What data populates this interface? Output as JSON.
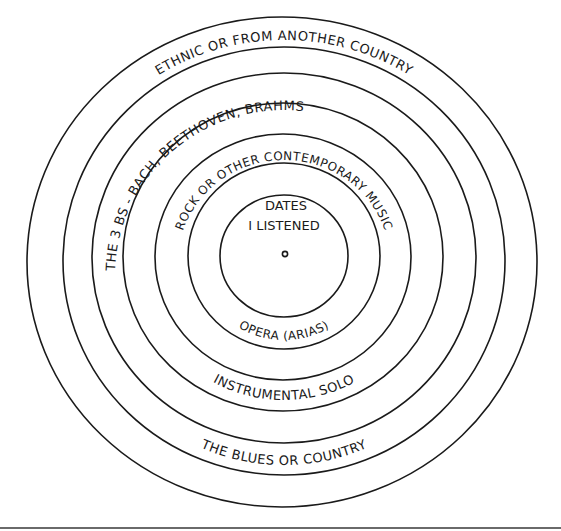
{
  "diagram": {
    "center_label": {
      "line1": "DATES",
      "line2": "I LISTENED"
    },
    "rings": [
      {
        "index": 1,
        "label": "OPERA (ARIAS)",
        "position": "bottom"
      },
      {
        "index": 2,
        "label": "ROCK OR OTHER CONTEMPORARY MUSIC",
        "position": "top"
      },
      {
        "index": 3,
        "label": "INSTRUMENTAL SOLO",
        "position": "bottom"
      },
      {
        "index": 4,
        "label": "THE 3 BS - BACH, BEETHOVEN, BRAHMS",
        "position": "top-left"
      },
      {
        "index": 5,
        "label": "THE BLUES OR COUNTRY",
        "position": "bottom"
      },
      {
        "index": 6,
        "label": "ETHNIC OR FROM ANOTHER COUNTRY",
        "position": "top"
      }
    ],
    "ring_count": 7,
    "stroke_color": "#1a1a1a",
    "background_color": "#ffffff",
    "rule_color": "#6a6a6a"
  }
}
